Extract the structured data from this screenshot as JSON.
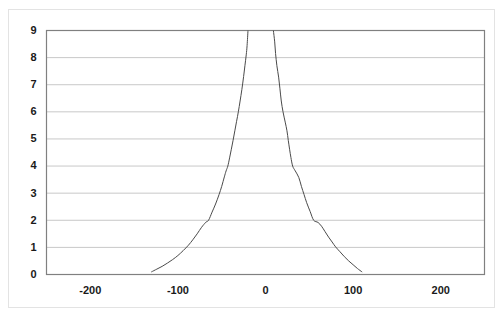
{
  "chart_data": {
    "type": "line",
    "title": "",
    "subtitle": "",
    "xlabel": "",
    "ylabel": "",
    "xlim": [
      -250,
      250
    ],
    "ylim": [
      0,
      9
    ],
    "xticks": [
      -200,
      -100,
      0,
      100,
      200
    ],
    "xtick_labels": [
      "-200",
      "-100",
      "0",
      "100",
      "200"
    ],
    "yticks": [
      0,
      1,
      2,
      3,
      4,
      5,
      6,
      7,
      8,
      9
    ],
    "ytick_labels": [
      "0",
      "1",
      "2",
      "3",
      "4",
      "5",
      "6",
      "7",
      "8",
      "9"
    ],
    "grid": {
      "horizontal": true,
      "vertical": false,
      "color": "#c8c8c8"
    },
    "legend": {
      "visible": false,
      "position": "none",
      "entries": []
    },
    "annotations": [],
    "series": [
      {
        "name": "left-branch",
        "color": "#4a4a4a",
        "line_width": 1,
        "marker": "none",
        "points": [
          [
            -130.0,
            0.1
          ],
          [
            -124.0,
            0.2
          ],
          [
            -118.0,
            0.3
          ],
          [
            -112.0,
            0.42
          ],
          [
            -106.0,
            0.55
          ],
          [
            -100.0,
            0.7
          ],
          [
            -94.0,
            0.88
          ],
          [
            -88.0,
            1.08
          ],
          [
            -83.0,
            1.28
          ],
          [
            -78.0,
            1.5
          ],
          [
            -73.0,
            1.74
          ],
          [
            -68.0,
            1.93
          ],
          [
            -65.0,
            2.0
          ],
          [
            -61.0,
            2.3
          ],
          [
            -57.0,
            2.6
          ],
          [
            -53.0,
            2.95
          ],
          [
            -50.0,
            3.25
          ],
          [
            -47.0,
            3.6
          ],
          [
            -45.0,
            3.82
          ],
          [
            -43.0,
            4.0
          ],
          [
            -41.0,
            4.3
          ],
          [
            -39.0,
            4.62
          ],
          [
            -37.0,
            4.95
          ],
          [
            -35.0,
            5.3
          ],
          [
            -33.0,
            5.65
          ],
          [
            -31.0,
            6.0
          ],
          [
            -29.0,
            6.4
          ],
          [
            -27.0,
            6.82
          ],
          [
            -25.0,
            7.3
          ],
          [
            -23.5,
            7.7
          ],
          [
            -22.0,
            8.1
          ],
          [
            -21.0,
            8.45
          ],
          [
            -20.0,
            9.0
          ]
        ]
      },
      {
        "name": "right-branch",
        "color": "#4a4a4a",
        "line_width": 1,
        "marker": "none",
        "points": [
          [
            110.0,
            0.1
          ],
          [
            105.0,
            0.22
          ],
          [
            100.0,
            0.36
          ],
          [
            95.0,
            0.5
          ],
          [
            90.0,
            0.66
          ],
          [
            85.0,
            0.84
          ],
          [
            80.0,
            1.02
          ],
          [
            76.0,
            1.2
          ],
          [
            72.0,
            1.38
          ],
          [
            68.0,
            1.58
          ],
          [
            64.0,
            1.78
          ],
          [
            60.0,
            1.92
          ],
          [
            55.0,
            2.0
          ],
          [
            51.0,
            2.32
          ],
          [
            47.0,
            2.65
          ],
          [
            44.0,
            2.95
          ],
          [
            41.0,
            3.25
          ],
          [
            38.0,
            3.58
          ],
          [
            34.0,
            3.82
          ],
          [
            31.0,
            4.0
          ],
          [
            29.0,
            4.32
          ],
          [
            27.5,
            4.62
          ],
          [
            26.0,
            4.95
          ],
          [
            24.5,
            5.3
          ],
          [
            22.5,
            5.62
          ],
          [
            20.0,
            6.0
          ],
          [
            18.0,
            6.4
          ],
          [
            16.5,
            6.85
          ],
          [
            15.0,
            7.28
          ],
          [
            13.0,
            7.7
          ],
          [
            11.5,
            8.15
          ],
          [
            10.5,
            8.58
          ],
          [
            9.0,
            9.0
          ]
        ]
      }
    ]
  },
  "axes": {
    "plot_border_color": "#808080",
    "plot_background": "#ffffff"
  }
}
